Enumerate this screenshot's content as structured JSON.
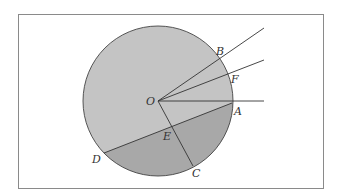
{
  "diagram": {
    "type": "geometry-circle",
    "colors": {
      "frame": "#8a8a8a",
      "circle_fill_light": "#c4c4c4",
      "circle_fill_dark": "#a8a8a8",
      "line": "#333333",
      "background": "#ffffff"
    },
    "points": {
      "O": {
        "label": "O"
      },
      "A": {
        "label": "A"
      },
      "B": {
        "label": "B"
      },
      "F": {
        "label": "F"
      },
      "C": {
        "label": "C"
      },
      "D": {
        "label": "D"
      },
      "E": {
        "label": "E"
      }
    }
  }
}
